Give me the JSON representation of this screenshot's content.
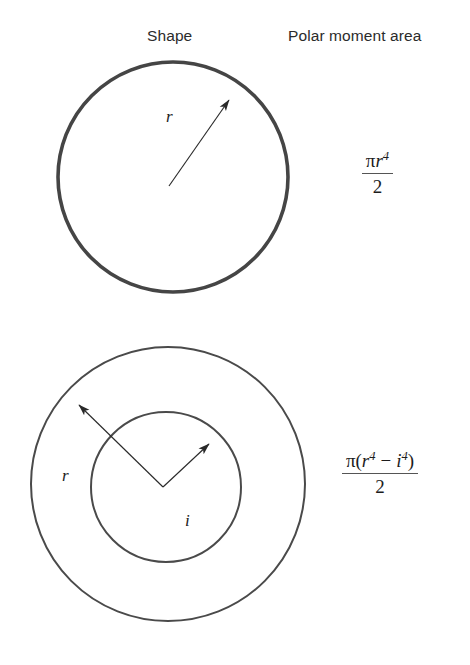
{
  "figure": {
    "title_columns": {
      "shape": "Shape",
      "polar_moment": "Polar moment area"
    },
    "rows": [
      {
        "id": "solid-circle",
        "shape_name": "solid circle",
        "labels": [
          {
            "name": "outer-radius",
            "text": "r"
          }
        ],
        "formula": {
          "plain": "πr⁴ / 2",
          "numerator_pi": "π",
          "numerator_var": "r",
          "numerator_exp": "4",
          "denominator": "2"
        }
      },
      {
        "id": "annulus",
        "shape_name": "annulus (hollow circle)",
        "labels": [
          {
            "name": "outer-radius",
            "text": "r"
          },
          {
            "name": "inner-radius",
            "text": "i"
          }
        ],
        "formula": {
          "plain": "π(r⁴ − i⁴) / 2",
          "numerator_pi": "π",
          "open_paren": "(",
          "numerator_var_outer": "r",
          "numerator_exp_outer": "4",
          "minus": "−",
          "numerator_var_inner": "i",
          "numerator_exp_inner": "4",
          "close_paren": ")",
          "denominator": "2"
        }
      }
    ],
    "colors": {
      "stroke_heavy": "#454545",
      "stroke_light": "#4a4a4a",
      "text": "#1c1c1c",
      "background": "#ffffff"
    },
    "geometry": {
      "solid_circle": {
        "cx": 173,
        "cy": 177,
        "r": 115,
        "stroke_width": 3.6
      },
      "annulus_outer": {
        "cx": 168,
        "cy": 484,
        "r": 137,
        "stroke_width": 2
      },
      "annulus_inner": {
        "cx": 166,
        "cy": 487,
        "r": 75,
        "stroke_width": 2
      }
    }
  }
}
